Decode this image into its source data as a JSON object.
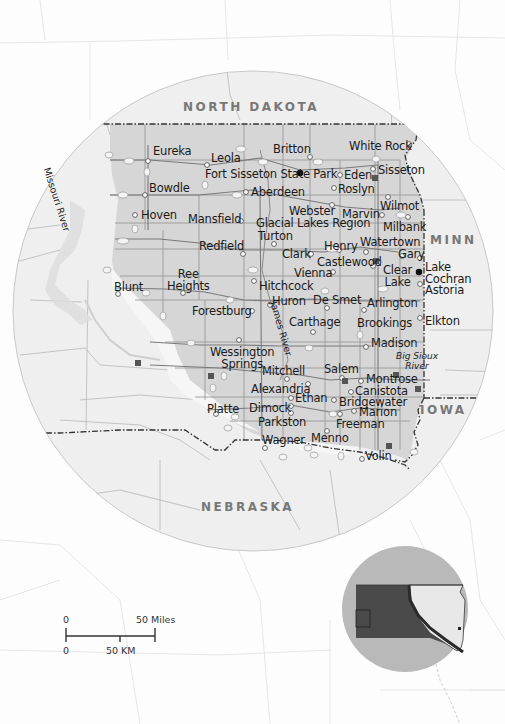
{
  "map": {
    "states": {
      "north_dakota": "NORTH DAKOTA",
      "nebraska": "NEBRASKA",
      "minnesota": "MINN",
      "iowa": "IOWA"
    },
    "rivers": {
      "missouri": "Missouri River",
      "james": "James River",
      "big_sioux": "Big Sioux\nRiver"
    },
    "towns": [
      {
        "name": "Eureka",
        "x": 151,
        "y": 144
      },
      {
        "name": "Leola",
        "x": 211,
        "y": 152
      },
      {
        "name": "Britton",
        "x": 273,
        "y": 144
      },
      {
        "name": "White Rock",
        "x": 349,
        "y": 139
      },
      {
        "name": "Fort Sisseton State Park",
        "x": 205,
        "y": 167
      },
      {
        "name": "Eden",
        "x": 344,
        "y": 168
      },
      {
        "name": "Sisseton",
        "x": 378,
        "y": 163
      },
      {
        "name": "Roslyn",
        "x": 338,
        "y": 184
      },
      {
        "name": "Bowdle",
        "x": 148,
        "y": 182
      },
      {
        "name": "Aberdeen",
        "x": 251,
        "y": 185
      },
      {
        "name": "Wilmot",
        "x": 380,
        "y": 201
      },
      {
        "name": "Webster",
        "x": 289,
        "y": 201
      },
      {
        "name": "Marvin",
        "x": 342,
        "y": 210
      },
      {
        "name": "Hoven",
        "x": 140,
        "y": 209
      },
      {
        "name": "Mansfield",
        "x": 188,
        "y": 216
      },
      {
        "name": "Glacial Lakes Region",
        "x": 256,
        "y": 218
      },
      {
        "name": "Milbank",
        "x": 383,
        "y": 222
      },
      {
        "name": "Turton",
        "x": 258,
        "y": 233
      },
      {
        "name": "Henry",
        "x": 324,
        "y": 241
      },
      {
        "name": "Watertown",
        "x": 360,
        "y": 237
      },
      {
        "name": "Redfield",
        "x": 199,
        "y": 243
      },
      {
        "name": "Clark",
        "x": 282,
        "y": 249
      },
      {
        "name": "Gary",
        "x": 398,
        "y": 248
      },
      {
        "name": "Castlewood",
        "x": 317,
        "y": 258
      },
      {
        "name": "Vienna",
        "x": 294,
        "y": 266
      },
      {
        "name": "Clear\nLake",
        "x": 383,
        "y": 266
      },
      {
        "name": "Ree\nHeights",
        "x": 167,
        "y": 269
      },
      {
        "name": "Hitchcock",
        "x": 259,
        "y": 279
      },
      {
        "name": "Blunt",
        "x": 114,
        "y": 280
      },
      {
        "name": "Huron",
        "x": 272,
        "y": 296
      },
      {
        "name": "De Smet",
        "x": 312,
        "y": 294
      },
      {
        "name": "Arlington",
        "x": 367,
        "y": 296
      },
      {
        "name": "Forestburg",
        "x": 192,
        "y": 303
      },
      {
        "name": "Carthage",
        "x": 289,
        "y": 316
      },
      {
        "name": "Brookings",
        "x": 357,
        "y": 316
      },
      {
        "name": "Elkton",
        "x": 425,
        "y": 315
      },
      {
        "name": "Madison",
        "x": 371,
        "y": 336
      },
      {
        "name": "Wessington\nSprings",
        "x": 210,
        "y": 345
      },
      {
        "name": "Mitchell",
        "x": 262,
        "y": 365
      },
      {
        "name": "Salem",
        "x": 324,
        "y": 363
      },
      {
        "name": "Montrose",
        "x": 366,
        "y": 372
      },
      {
        "name": "Alexandria",
        "x": 251,
        "y": 382
      },
      {
        "name": "Canistota",
        "x": 355,
        "y": 385
      },
      {
        "name": "Ethan",
        "x": 295,
        "y": 392
      },
      {
        "name": "Bridgewater",
        "x": 339,
        "y": 396
      },
      {
        "name": "Platte",
        "x": 207,
        "y": 402
      },
      {
        "name": "Dimock",
        "x": 249,
        "y": 401
      },
      {
        "name": "Marion",
        "x": 359,
        "y": 406
      },
      {
        "name": "Parkston",
        "x": 258,
        "y": 416
      },
      {
        "name": "Freeman",
        "x": 336,
        "y": 418
      },
      {
        "name": "Wagner",
        "x": 262,
        "y": 434
      },
      {
        "name": "Menno",
        "x": 311,
        "y": 433
      },
      {
        "name": "Volin",
        "x": 367,
        "y": 450
      },
      {
        "name": "Lake\nCochran",
        "x": 425,
        "y": 262
      },
      {
        "name": "Astoria",
        "x": 425,
        "y": 284
      }
    ],
    "parks": [
      {
        "name": "Fort Sisseton State Park",
        "x": 300,
        "y": 173
      },
      {
        "name": "Lake Cochran",
        "x": 419,
        "y": 272
      }
    ],
    "route_shields": [
      "83",
      "10",
      "47",
      "12",
      "45",
      "212",
      "281",
      "14",
      "34",
      "28",
      "127",
      "22",
      "81",
      "50",
      "44",
      "46",
      "25",
      "90",
      "29"
    ],
    "scale_bar": {
      "miles_zero": "0",
      "miles_label": "50 Miles",
      "km_zero": "0",
      "km_label": "50 KM"
    },
    "locator_map": {
      "description": "South Dakota locator inset"
    }
  },
  "colors": {
    "region_fill": "#d8d8d8",
    "circle_fill": "#ececec",
    "locator_circle": "#b9b9b9",
    "locator_dark": "#4a4a4a",
    "locator_light": "#e8e8e8",
    "text": "#1a1a1a",
    "state_label": "#777777"
  }
}
